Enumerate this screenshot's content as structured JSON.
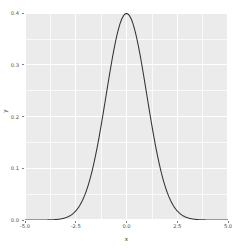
{
  "chart_data": {
    "type": "line",
    "title": "",
    "subtitle": "",
    "xlabel": "x",
    "ylabel": "y",
    "xlim": [
      -5.0,
      5.0
    ],
    "ylim": [
      0.0,
      0.4
    ],
    "grid": true,
    "legend": null,
    "legend_position": "none",
    "distribution": "normal",
    "mean": 0.0,
    "sd": 1.0,
    "peak_value": 0.3989,
    "x_ticks": [
      "-5.0",
      "-2.5",
      "0.0",
      "2.5",
      "5.0"
    ],
    "x_tick_values": [
      -5.0,
      -2.5,
      0.0,
      2.5,
      5.0
    ],
    "y_ticks": [
      "0.0",
      "0.1",
      "0.2",
      "0.3",
      "0.4"
    ],
    "y_tick_values": [
      0.0,
      0.1,
      0.2,
      0.3,
      0.4
    ],
    "x_minor_ticks": [
      -3.75,
      -1.25,
      1.25,
      3.75
    ],
    "y_minor_ticks": [
      0.05,
      0.15,
      0.25,
      0.35
    ],
    "series": [
      {
        "name": "dnorm(x)",
        "color": "#333333",
        "x": [
          -5.0,
          -4.75,
          -4.5,
          -4.25,
          -4.0,
          -3.75,
          -3.5,
          -3.25,
          -3.0,
          -2.75,
          -2.5,
          -2.25,
          -2.0,
          -1.75,
          -1.5,
          -1.25,
          -1.0,
          -0.75,
          -0.5,
          -0.25,
          0.0,
          0.25,
          0.5,
          0.75,
          1.0,
          1.25,
          1.5,
          1.75,
          2.0,
          2.25,
          2.5,
          2.75,
          3.0,
          3.25,
          3.5,
          3.75,
          4.0,
          4.25,
          4.5,
          4.75,
          5.0
        ],
        "values": [
          0.0,
          0.0,
          0.0,
          0.0001,
          0.0001,
          0.0004,
          0.0009,
          0.002,
          0.0044,
          0.0091,
          0.0175,
          0.0317,
          0.054,
          0.0863,
          0.1295,
          0.1826,
          0.242,
          0.3011,
          0.3521,
          0.3867,
          0.3989,
          0.3867,
          0.3521,
          0.3011,
          0.242,
          0.1826,
          0.1295,
          0.0863,
          0.054,
          0.0317,
          0.0175,
          0.0091,
          0.0044,
          0.002,
          0.0009,
          0.0004,
          0.0001,
          0.0001,
          0.0,
          0.0,
          0.0
        ]
      }
    ],
    "colors": {
      "panel_background": "#ebebeb",
      "figure_background": "#ffffff",
      "gridline": "#ffffff",
      "line": "#333333",
      "tick_label": "#4d4d4d",
      "axis_title": "#333333"
    }
  }
}
